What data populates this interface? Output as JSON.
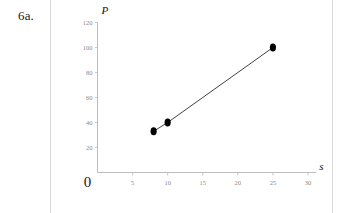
{
  "problem": {
    "number_label": "6a."
  },
  "chart_data": {
    "type": "scatter",
    "title": "",
    "subtitle": "",
    "xlabel": "s",
    "ylabel": "P",
    "xlim": [
      0,
      30
    ],
    "ylim": [
      0,
      120
    ],
    "grid": false,
    "legend": null,
    "origin_label": "0",
    "x_ticks": [
      {
        "value": 5,
        "label": "5"
      },
      {
        "value": 10,
        "label": "10"
      },
      {
        "value": 15,
        "label": "15"
      },
      {
        "value": 20,
        "label": "20"
      },
      {
        "value": 25,
        "label": "25"
      },
      {
        "value": 30,
        "label": "30"
      }
    ],
    "y_ticks": [
      {
        "value": 20,
        "label": "20"
      },
      {
        "value": 40,
        "label": "40"
      },
      {
        "value": 60,
        "label": "60"
      },
      {
        "value": 80,
        "label": "80"
      },
      {
        "value": 100,
        "label": "100"
      },
      {
        "value": 120,
        "label": "120"
      }
    ],
    "points": [
      {
        "x": 8,
        "y": 33
      },
      {
        "x": 10,
        "y": 40
      },
      {
        "x": 25,
        "y": 100
      }
    ],
    "connect_points": true,
    "marker": "filled-circle",
    "marker_color": "#000000",
    "line_color": "#2b2b2b",
    "axis_color": "#bdbdbd",
    "tick_label_color": "#8a8a8a"
  }
}
